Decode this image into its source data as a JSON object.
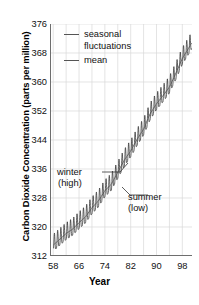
{
  "chart_data": {
    "type": "line",
    "title": "",
    "xlabel": "Year",
    "ylabel": "Carbon Dioxide Concentration (parts per million)",
    "xlim": [
      1957,
      2001
    ],
    "ylim": [
      312,
      376
    ],
    "xticks": [
      "58",
      "66",
      "74",
      "82",
      "90",
      "98"
    ],
    "xtick_values": [
      1958,
      1966,
      1974,
      1982,
      1990,
      1998
    ],
    "yticks": [
      "312",
      "320",
      "328",
      "336",
      "344",
      "352",
      "360",
      "368",
      "376"
    ],
    "ytick_values": [
      312,
      320,
      328,
      336,
      344,
      352,
      360,
      368,
      376
    ],
    "grid": "both",
    "legend_position": "top-left",
    "series": [
      {
        "name": "seasonal fluctuations",
        "color": "#303030",
        "description": "Monthly CO2 record showing sawtooth annual cycle superimposed on rising trend",
        "amplitude_ppm": 3.0
      },
      {
        "name": "mean",
        "color": "#606060",
        "description": "Smoothed annual mean trend line through the seasonal oscillation"
      }
    ],
    "x": [
      1958,
      1960,
      1962,
      1964,
      1966,
      1968,
      1970,
      1972,
      1974,
      1976,
      1978,
      1980,
      1982,
      1984,
      1986,
      1988,
      1990,
      1992,
      1994,
      1996,
      1998,
      2000,
      2001
    ],
    "mean_values": [
      315.0,
      316.6,
      318.2,
      319.4,
      321.2,
      322.8,
      325.3,
      327.2,
      330.0,
      331.8,
      335.1,
      338.4,
      341.0,
      344.2,
      347.0,
      351.2,
      354.0,
      356.2,
      358.6,
      362.4,
      366.5,
      369.4,
      371.0
    ],
    "annotations": [
      {
        "text_line1": "winter",
        "text_line2": "(high)",
        "points_to": "seasonal maximum",
        "x": 1975,
        "y": 332.5
      },
      {
        "text_line1": "summer",
        "text_line2": "(low)",
        "points_to": "seasonal minimum",
        "x": 1976,
        "y": 329.0
      }
    ]
  },
  "legend": {
    "items": [
      {
        "label_line1": "seasonal",
        "label_line2": "fluctuations"
      },
      {
        "label_line1": "mean",
        "label_line2": ""
      }
    ]
  },
  "axes": {
    "y_title": "Carbon Dioxide Concentration (parts per million)",
    "x_title": "Year"
  },
  "colors": {
    "background": "#ffffff",
    "grid": "#d8d8d8",
    "axis": "#7a7a7a",
    "data": "#303030",
    "mean": "#606060",
    "text": "#111111"
  }
}
